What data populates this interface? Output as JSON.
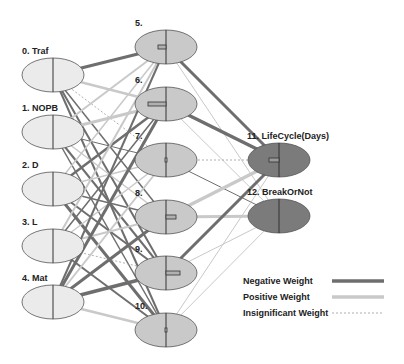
{
  "colors": {
    "negative": "#6e6e6e",
    "positive": "#c9c9c9",
    "insignificant": "#9a9a9a",
    "input_fill": "#ebebeb",
    "hidden_fill": "#c9c9c9",
    "output_fill": "#7b7b7b",
    "stroke": "#555555"
  },
  "network": {
    "input_nodes": [
      {
        "id": 0,
        "label": "0. Traf"
      },
      {
        "id": 1,
        "label": "1. NOPB"
      },
      {
        "id": 2,
        "label": "2. D"
      },
      {
        "id": 3,
        "label": "3. L"
      },
      {
        "id": 4,
        "label": "4. Mat"
      }
    ],
    "hidden_nodes": [
      {
        "id": 5,
        "label": "5."
      },
      {
        "id": 6,
        "label": "6."
      },
      {
        "id": 7,
        "label": "7."
      },
      {
        "id": 8,
        "label": "8."
      },
      {
        "id": 9,
        "label": "9."
      },
      {
        "id": 10,
        "label": "10."
      }
    ],
    "output_nodes": [
      {
        "id": 11,
        "label": "11. LifeCycle(Days)"
      },
      {
        "id": 12,
        "label": "12. BreakOrNot"
      }
    ]
  },
  "legend": {
    "items": [
      {
        "label": "Negative Weight",
        "style": "negative"
      },
      {
        "label": "Positive Weight",
        "style": "positive"
      },
      {
        "label": "Insignificant Weight",
        "style": "insignificant"
      }
    ]
  }
}
